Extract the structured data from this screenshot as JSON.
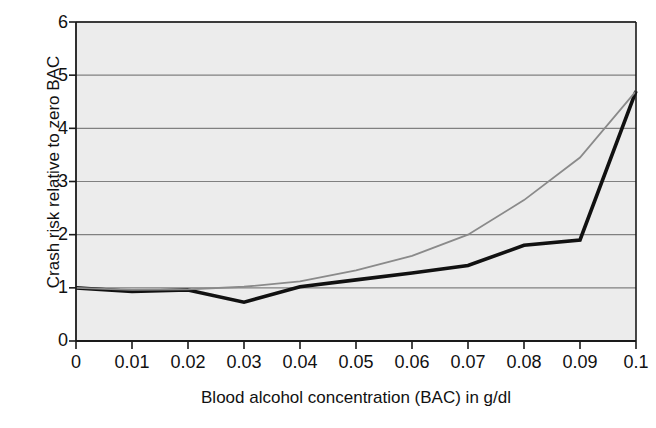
{
  "chart_data": {
    "type": "line",
    "title": "",
    "xlabel": "Blood alcohol concentration (BAC) in g/dl",
    "ylabel": "Crash risk relative to zero BAC",
    "x": [
      0,
      0.01,
      0.02,
      0.03,
      0.04,
      0.05,
      0.06,
      0.07,
      0.08,
      0.09,
      0.1
    ],
    "xtick_labels": [
      "0",
      "0.01",
      "0.02",
      "0.03",
      "0.04",
      "0.05",
      "0.06",
      "0.07",
      "0.08",
      "0.09",
      "0.1"
    ],
    "ytick_labels": [
      "0",
      "1",
      "2",
      "3",
      "4",
      "5",
      "6"
    ],
    "ytick_values": [
      0,
      1,
      2,
      3,
      4,
      5,
      6
    ],
    "xlim": [
      0,
      0.1
    ],
    "ylim": [
      0,
      6
    ],
    "grid": "horizontal",
    "legend": "none",
    "plot_background": "#ececec",
    "gridline_color": "#808080",
    "frame_color": "#1a1a1a",
    "series": [
      {
        "name": "black-series",
        "color": "#111111",
        "width": 3.6,
        "values": [
          1.0,
          0.93,
          0.96,
          0.73,
          1.02,
          1.15,
          1.28,
          1.42,
          1.8,
          1.9,
          4.7
        ]
      },
      {
        "name": "gray-series",
        "color": "#8a8a8a",
        "width": 1.8,
        "values": [
          1.0,
          0.96,
          0.97,
          1.02,
          1.12,
          1.33,
          1.6,
          2.0,
          2.65,
          3.45,
          4.7
        ]
      }
    ]
  }
}
